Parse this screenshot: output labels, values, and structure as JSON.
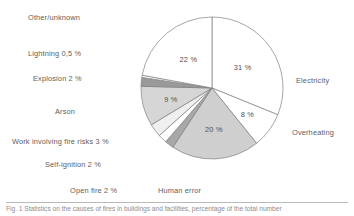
{
  "figure": {
    "caption": "Fig. 1  Statistics on the causes of fires in buildings and facilities, percentage of the total number",
    "has_caption_rule": true
  },
  "chart_data": {
    "type": "pie",
    "title": "",
    "xlabel": "",
    "ylabel": "",
    "legend_position": "none",
    "grid": false,
    "start_angle_deg": 0,
    "direction": "clockwise",
    "units": "%",
    "decimal_separator": ",",
    "categories": [
      "Electricity",
      "Overheating",
      "Human error",
      "Open fire",
      "Self-ignition",
      "Work involving fire risks",
      "Arson",
      "Explosion",
      "Lightning",
      "Other/unknown"
    ],
    "values": [
      31,
      8,
      20,
      2,
      2,
      3,
      9,
      2,
      0.5,
      22
    ],
    "value_labels": [
      "31 %",
      "8 %",
      "20 %",
      "2 %",
      "2 %",
      "3 %",
      "9 %",
      "2 %",
      "0,5 %",
      "22 %"
    ],
    "slice_colors": [
      "#ffffff",
      "#ffffff",
      "#cfcfcf",
      "#a8a8a8",
      "#ffffff",
      "#efefef",
      "#d6d6d6",
      "#9a9a9a",
      "#ffffff",
      "#ffffff"
    ],
    "stroke_color": "#808080",
    "slices": [
      {
        "name": "Electricity",
        "value": 31,
        "value_label": "31 %",
        "color": "#ffffff",
        "label_text": "Electricity",
        "label_side": "right",
        "inside_label": true
      },
      {
        "name": "Overheating",
        "value": 8,
        "value_label": "8 %",
        "color": "#ffffff",
        "label_text": "Overheating",
        "label_side": "right",
        "inside_label": true
      },
      {
        "name": "Human error",
        "value": 20,
        "value_label": "20 %",
        "color": "#cfcfcf",
        "label_text": "Human error",
        "label_side": "bottom",
        "inside_label": true
      },
      {
        "name": "Open fire",
        "value": 2,
        "value_label": "2 %",
        "color": "#a8a8a8",
        "label_text": "Open fire 2 %",
        "label_side": "left",
        "inside_label": false
      },
      {
        "name": "Self-ignition",
        "value": 2,
        "value_label": "2 %",
        "color": "#ffffff",
        "label_text": "Self-ignition 2 %",
        "label_side": "left",
        "inside_label": false
      },
      {
        "name": "Work involving fire risks",
        "value": 3,
        "value_label": "3 %",
        "color": "#efefef",
        "label_text": "Work involving fire risks  3 %",
        "label_side": "left",
        "inside_label": false
      },
      {
        "name": "Arson",
        "value": 9,
        "value_label": "9 %",
        "color": "#d6d6d6",
        "label_text": "Arson",
        "label_side": "left",
        "inside_label": true
      },
      {
        "name": "Explosion",
        "value": 2,
        "value_label": "2 %",
        "color": "#9a9a9a",
        "label_text": "Explosion 2 %",
        "label_side": "left",
        "inside_label": false
      },
      {
        "name": "Lightning",
        "value": 0.5,
        "value_label": "0,5 %",
        "color": "#ffffff",
        "label_text": "Lightning  0,5 %",
        "label_side": "left",
        "inside_label": false
      },
      {
        "name": "Other/unknown",
        "value": 22,
        "value_label": "22 %",
        "color": "#ffffff",
        "label_text": "Other/unknown",
        "label_side": "top",
        "inside_label": true
      }
    ]
  },
  "labels": {
    "other_unknown": "Other/unknown",
    "lightning": "Lightning  0,5 %",
    "explosion": "Explosion 2 %",
    "arson": "Arson",
    "work_fire_risks": "Work involving fire risks  3 %",
    "self_ignition": "Self-ignition 2 %",
    "open_fire": "Open fire 2 %",
    "human_error": "Human error",
    "electricity": "Electricity",
    "overheating": "Overheating"
  },
  "values": {
    "other_unknown": "22 %",
    "electricity": "31 %",
    "overheating": "8 %",
    "human_error": "20 %",
    "arson": "9 %"
  }
}
